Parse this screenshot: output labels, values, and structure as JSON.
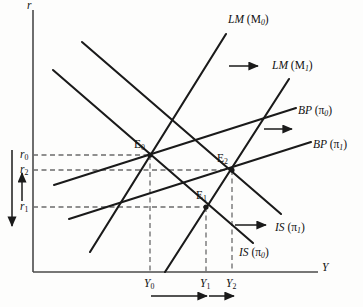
{
  "figure": {
    "type": "economics-diagram",
    "model": "IS-LM-BP",
    "background_color": "#fdfdfc",
    "line_color": "#1a1a1a",
    "axes": {
      "y_axis_label": "r",
      "x_axis_label": "Y",
      "origin": [
        33,
        272
      ],
      "y_top": 10,
      "x_right": 318
    },
    "curves": [
      {
        "name": "LM-M0",
        "label_main": "LM",
        "label_arg": "(M",
        "label_sub": "0",
        "label_close": ")",
        "label_x": 228,
        "label_y": 14,
        "x1": 90,
        "y1": 252,
        "x2": 226,
        "y2": 34
      },
      {
        "name": "LM-M1",
        "label_main": "LM",
        "label_arg": "(M",
        "label_sub": "1",
        "label_close": ")",
        "label_x": 272,
        "label_y": 60,
        "x1": 165,
        "y1": 272,
        "x2": 289,
        "y2": 79
      },
      {
        "name": "BP-pi0",
        "label_main": "BP",
        "label_arg": "(π",
        "label_sub": "0",
        "label_close": ")",
        "label_x": 298,
        "label_y": 105,
        "x1": 54,
        "y1": 185,
        "x2": 296,
        "y2": 108
      },
      {
        "name": "BP-pi1",
        "label_main": "BP",
        "label_arg": "(π",
        "label_sub": "1",
        "label_close": ")",
        "label_x": 313,
        "label_y": 139,
        "x1": 69,
        "y1": 219,
        "x2": 311,
        "y2": 142
      },
      {
        "name": "IS-pi1",
        "label_main": "IS",
        "label_arg": "(π",
        "label_sub": "1",
        "label_close": ")",
        "label_x": 275,
        "label_y": 222,
        "x1": 82,
        "y1": 42,
        "x2": 281,
        "y2": 214
      },
      {
        "name": "IS-pi0",
        "label_main": "IS",
        "label_arg": "(π",
        "label_sub": "0",
        "label_close": ")",
        "label_x": 239,
        "label_y": 247,
        "x1": 53,
        "y1": 70,
        "x2": 253,
        "y2": 243
      }
    ],
    "equilibria": [
      {
        "name": "E0",
        "label": "E",
        "sub": "0",
        "x": 150,
        "y": 155,
        "label_x": 134,
        "label_y": 139
      },
      {
        "name": "E1",
        "label": "E",
        "sub": "1",
        "x": 206,
        "y": 207,
        "label_x": 196,
        "label_y": 190
      },
      {
        "name": "E2",
        "label": "E",
        "sub": "2",
        "x": 232,
        "y": 170,
        "label_x": 217,
        "label_y": 153
      }
    ],
    "y_ticks": [
      {
        "name": "r0",
        "label": "r",
        "sub": "0",
        "y": 155,
        "label_x": 20,
        "label_y": 149,
        "dash_to_x": 150
      },
      {
        "name": "r2",
        "label": "r",
        "sub": "2",
        "y": 170,
        "label_x": 20,
        "label_y": 164,
        "dash_to_x": 232
      },
      {
        "name": "r1",
        "label": "r",
        "sub": "1",
        "y": 207,
        "label_x": 20,
        "label_y": 201,
        "dash_to_x": 206
      }
    ],
    "x_ticks": [
      {
        "name": "Y0",
        "label": "Y",
        "sub": "0",
        "x": 150,
        "label_x": 144,
        "label_y": 278,
        "dash_from_y": 155
      },
      {
        "name": "Y1",
        "label": "Y",
        "sub": "1",
        "x": 206,
        "label_x": 200,
        "label_y": 278,
        "dash_from_y": 207
      },
      {
        "name": "Y2",
        "label": "Y",
        "sub": "2",
        "x": 232,
        "label_x": 226,
        "label_y": 278,
        "dash_from_y": 170
      }
    ],
    "shift_arrows": [
      {
        "name": "lm-shift-arrow",
        "x1": 229,
        "y1": 66,
        "x2": 258,
        "y2": 66,
        "direction": "right"
      },
      {
        "name": "bp-shift-arrow",
        "x1": 264,
        "y1": 129,
        "x2": 292,
        "y2": 129,
        "direction": "right"
      },
      {
        "name": "is-shift-arrow",
        "x1": 235,
        "y1": 225,
        "x2": 266,
        "y2": 225,
        "direction": "right"
      },
      {
        "name": "y0-to-y1-arrow",
        "x1": 151,
        "y1": 296,
        "x2": 207,
        "y2": 296,
        "direction": "right"
      },
      {
        "name": "y1-to-y2-arrow",
        "x1": 209,
        "y1": 296,
        "x2": 234,
        "y2": 296,
        "direction": "right"
      },
      {
        "name": "rate-drop-arrow",
        "x1": 12,
        "y1": 150,
        "x2": 12,
        "y2": 226,
        "direction": "down"
      },
      {
        "name": "rate-rise-arrow",
        "x1": 22,
        "y1": 201,
        "x2": 22,
        "y2": 173,
        "direction": "up"
      }
    ]
  }
}
